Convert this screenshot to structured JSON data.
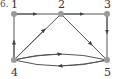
{
  "figure": {
    "prefix_label": "6.",
    "node_color": "#9a9a9a",
    "edge_color": "#555555",
    "nodes": [
      {
        "id": "1",
        "label": "1",
        "x": 14,
        "y": 14
      },
      {
        "id": "2",
        "label": "2",
        "x": 61,
        "y": 14
      },
      {
        "id": "3",
        "label": "3",
        "x": 107,
        "y": 14
      },
      {
        "id": "4",
        "label": "4",
        "x": 14,
        "y": 60
      },
      {
        "id": "5",
        "label": "5",
        "x": 107,
        "y": 60
      }
    ],
    "edges": [
      {
        "from": "1",
        "to": "2"
      },
      {
        "from": "2",
        "to": "3"
      },
      {
        "from": "3",
        "to": "5"
      },
      {
        "from": "4",
        "to": "1"
      },
      {
        "from": "4",
        "to": "2"
      },
      {
        "from": "2",
        "to": "5"
      },
      {
        "from": "4",
        "to": "5",
        "curve": "upper"
      },
      {
        "from": "5",
        "to": "4",
        "curve": "lower"
      }
    ]
  }
}
